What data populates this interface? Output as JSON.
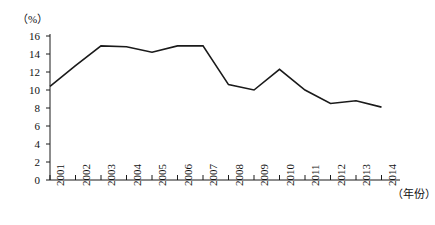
{
  "chart_data": {
    "type": "line",
    "title": "",
    "subtitle": "",
    "unit_label": "（%）",
    "xlabel": "（年份）",
    "ylabel": "",
    "x": [
      "2001",
      "2002",
      "2003",
      "2004",
      "2005",
      "2006",
      "2007",
      "2008",
      "2009",
      "2010",
      "2011",
      "2012",
      "2013",
      "2014"
    ],
    "values": [
      10.4,
      12.7,
      14.9,
      14.8,
      14.2,
      14.9,
      14.9,
      10.6,
      10.0,
      12.3,
      10.0,
      8.5,
      8.8,
      8.1
    ],
    "series": [
      {
        "name": "",
        "values": [
          10.4,
          12.7,
          14.9,
          14.8,
          14.2,
          14.9,
          14.9,
          10.6,
          10.0,
          12.3,
          10.0,
          8.5,
          8.8,
          8.1
        ]
      }
    ],
    "ylim": [
      0,
      16
    ],
    "yticks": [
      0,
      2,
      4,
      6,
      8,
      10,
      12,
      14,
      16
    ],
    "ytick_labels": [
      "0",
      "2",
      "4",
      "6",
      "8",
      "10",
      "12",
      "14",
      "16"
    ],
    "xtick_labels": [
      "2001",
      "2002",
      "2003",
      "2004",
      "2005",
      "2006",
      "2007",
      "2008",
      "2009",
      "2010",
      "2011",
      "2012",
      "2013",
      "2014"
    ],
    "grid": false,
    "legend": false,
    "legend_position": "none",
    "line_color": "#1a1a1a",
    "axis_color": "#1a1a1a",
    "background_color": "#ffffff",
    "markers": false
  }
}
